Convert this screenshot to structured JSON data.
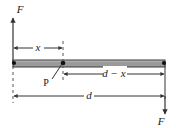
{
  "figure": {
    "colors": {
      "line": "#333333",
      "bar_fill": "#9a9a9a",
      "bar_edge": "#4a4a4a",
      "background": "#ffffff",
      "text": "#1a1a1a"
    },
    "bar": {
      "name": "horizontal-bar",
      "left": 13,
      "right": 165,
      "top": 60,
      "bottom": 67
    },
    "forces": [
      {
        "id": "force-up-left",
        "label": "F",
        "direction": "up",
        "x": 13,
        "label_x": 20,
        "label_y": 13,
        "tail_y": 60,
        "head_y": 17
      },
      {
        "id": "force-down-right",
        "label": "F",
        "direction": "down",
        "x": 165,
        "label_x": 161,
        "label_y": 125,
        "tail_y": 63,
        "head_y": 113
      }
    ],
    "points": [
      {
        "id": "point-p",
        "label": "P",
        "x": 63,
        "y": 63,
        "label_x": 46,
        "label_y": 86
      },
      {
        "id": "node-left",
        "label": "",
        "x": 14,
        "y": 63
      },
      {
        "id": "node-right",
        "label": "",
        "x": 164,
        "y": 63
      }
    ],
    "dimensions": [
      {
        "id": "dimension-x",
        "label": "x",
        "from": 13,
        "to": 63,
        "y": 48,
        "label_x": 38,
        "label_y": 51
      },
      {
        "id": "dimension-d-minus-x",
        "label": "d − x",
        "from": 63,
        "to": 165,
        "y": 74,
        "label_x": 114,
        "label_y": 77
      },
      {
        "id": "dimension-d",
        "label": "d",
        "from": 13,
        "to": 165,
        "y": 96,
        "label_x": 89,
        "label_y": 99
      }
    ],
    "extension_lines": [
      {
        "id": "extension-left",
        "x": 13,
        "from_y": 60,
        "to_y": 103,
        "style": "dashed"
      },
      {
        "id": "extension-middle",
        "x": 63,
        "from_y": 41,
        "to_y": 81,
        "style": "dashed"
      }
    ]
  }
}
